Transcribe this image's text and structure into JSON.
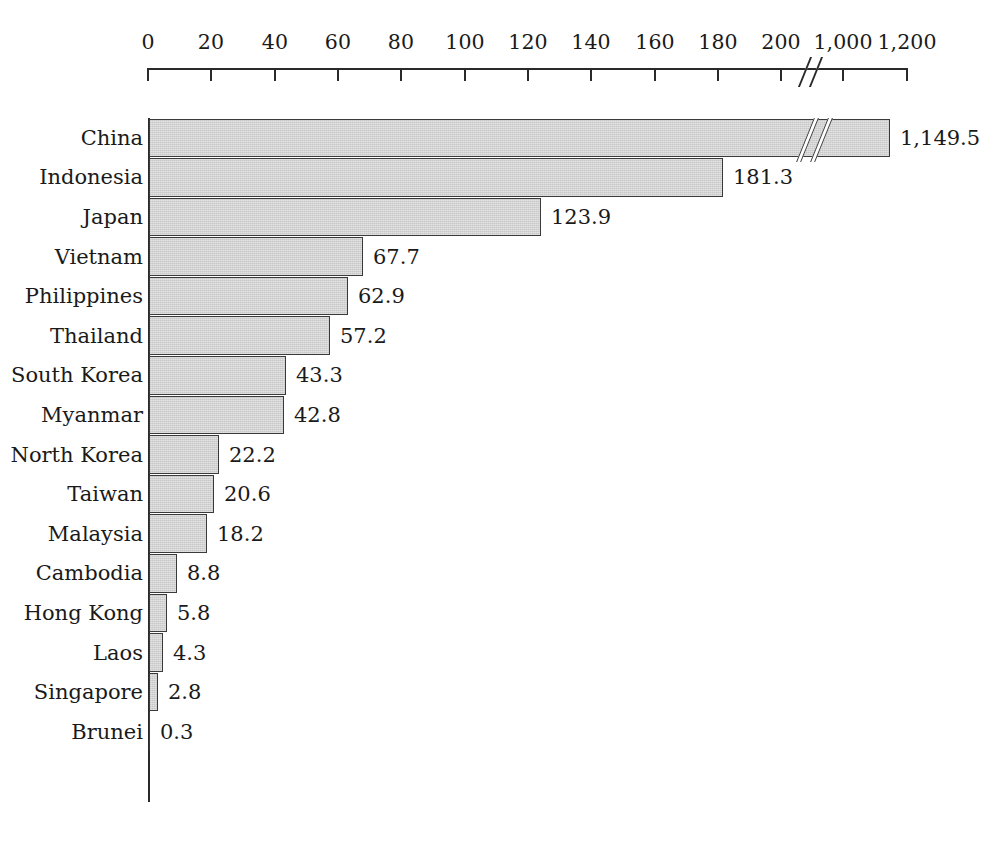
{
  "chart_data": {
    "type": "bar",
    "orientation": "horizontal",
    "title": "",
    "subtitle": "",
    "xlabel": "",
    "ylabel": "",
    "grid": false,
    "legend": null,
    "axis": {
      "ticks": [
        {
          "label": "0",
          "value": 0,
          "x": 148
        },
        {
          "label": "20",
          "value": 20,
          "x": 211
        },
        {
          "label": "40",
          "value": 40,
          "x": 275
        },
        {
          "label": "60",
          "value": 60,
          "x": 338
        },
        {
          "label": "80",
          "value": 80,
          "x": 401
        },
        {
          "label": "100",
          "value": 100,
          "x": 465
        },
        {
          "label": "120",
          "value": 120,
          "x": 528
        },
        {
          "label": "140",
          "value": 140,
          "x": 591
        },
        {
          "label": "160",
          "value": 160,
          "x": 655
        },
        {
          "label": "180",
          "value": 180,
          "x": 718
        },
        {
          "label": "200",
          "value": 200,
          "x": 781
        },
        {
          "label": "1,000",
          "value": 1000,
          "x": 843
        },
        {
          "label": "1,200",
          "value": 1200,
          "x": 907
        }
      ],
      "break": {
        "present": true,
        "between": [
          "200",
          "1,000"
        ],
        "x": 812
      },
      "xlim": [
        0,
        1200
      ]
    },
    "categories": [
      "China",
      "Indonesia",
      "Japan",
      "Vietnam",
      "Philippines",
      "Thailand",
      "South Korea",
      "Myanmar",
      "North Korea",
      "Taiwan",
      "Malaysia",
      "Cambodia",
      "Hong Kong",
      "Laos",
      "Singapore",
      "Brunei"
    ],
    "values": [
      1149.5,
      181.3,
      123.9,
      67.7,
      62.9,
      57.2,
      43.3,
      42.8,
      22.2,
      20.6,
      18.2,
      8.8,
      5.8,
      4.3,
      2.8,
      0.3
    ],
    "value_labels": [
      "1,149.5",
      "181.3",
      "123.9",
      "67.7",
      "62.9",
      "57.2",
      "43.3",
      "42.8",
      "22.2",
      "20.6",
      "18.2",
      "8.8",
      "5.8",
      "4.3",
      "2.8",
      "0.3"
    ],
    "bar_pixel_widths": [
      741,
      574,
      392,
      214,
      199,
      181,
      137,
      135,
      70,
      65,
      58,
      28,
      18,
      14,
      9,
      1
    ],
    "bar_break_x_offset": 655,
    "colors": {
      "bar_fill": "#d3d3d3",
      "bar_stroke": "#3a3a3a",
      "axis": "#2a2a2a",
      "text": "#1a1a1a",
      "background": "#ffffff"
    }
  }
}
